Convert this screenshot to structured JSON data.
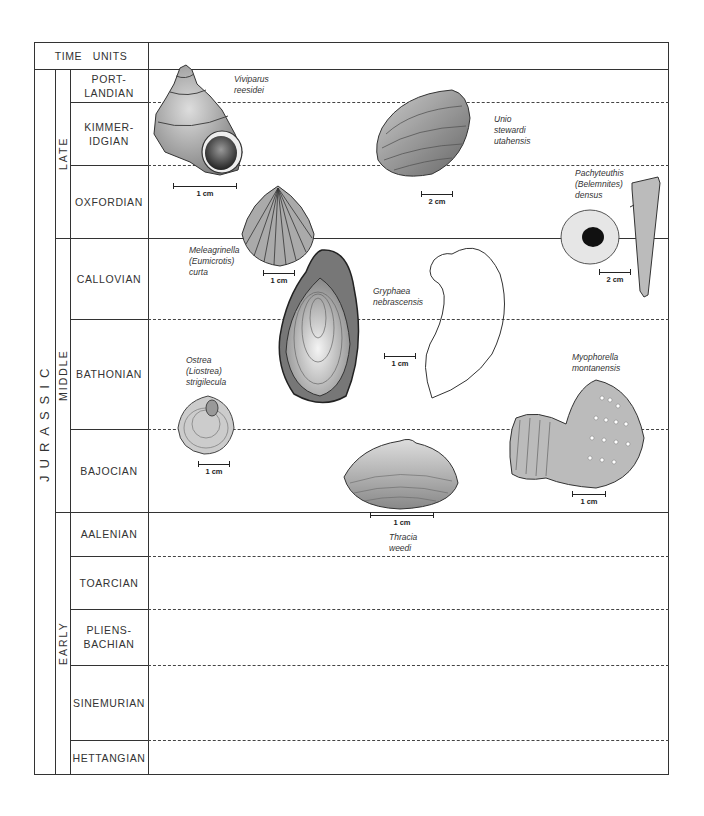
{
  "header": {
    "time_units": "TIME   UNITS"
  },
  "period": {
    "label": "JURASSIC"
  },
  "epochs": [
    {
      "label": "LATE"
    },
    {
      "label": "MIDDLE"
    },
    {
      "label": "EARLY"
    }
  ],
  "stages": [
    {
      "label": "PORT-\nLANDIAN",
      "epoch": "LATE"
    },
    {
      "label": "KIMMER-\nIDGIAN",
      "epoch": "LATE"
    },
    {
      "label": "OXFORDIAN",
      "epoch": "LATE"
    },
    {
      "label": "CALLOVIAN",
      "epoch": "MIDDLE"
    },
    {
      "label": "BATHONIAN",
      "epoch": "MIDDLE"
    },
    {
      "label": "BAJOCIAN",
      "epoch": "MIDDLE"
    },
    {
      "label": "AALENIAN",
      "epoch": "EARLY"
    },
    {
      "label": "TOARCIAN",
      "epoch": "EARLY"
    },
    {
      "label": "PLIENS-\nBACHIAN",
      "epoch": "EARLY"
    },
    {
      "label": "SINEMURIAN",
      "epoch": "EARLY"
    },
    {
      "label": "HETTANGIAN",
      "epoch": "EARLY"
    }
  ],
  "fossils": [
    {
      "name": "Viviparus\nreesidei",
      "scale": "1 cm"
    },
    {
      "name": "Unio\nstewardi\nutahensis",
      "scale": "2 cm"
    },
    {
      "name": "Pachyteuthis\n(Belemnites)\ndensus",
      "scale": "2 cm"
    },
    {
      "name": "Meleagrinella\n(Eumicrotis)\ncurta",
      "scale": "1 cm"
    },
    {
      "name": "Gryphaea\nnebrascensis",
      "scale": "1 cm"
    },
    {
      "name": "Ostrea\n(Liostrea)\nstrigilecula",
      "scale": "1 cm"
    },
    {
      "name": "Myophorella\nmontanensis",
      "scale": "1 cm"
    },
    {
      "name": "Thracia\nweedi",
      "scale": "1 cm"
    }
  ]
}
